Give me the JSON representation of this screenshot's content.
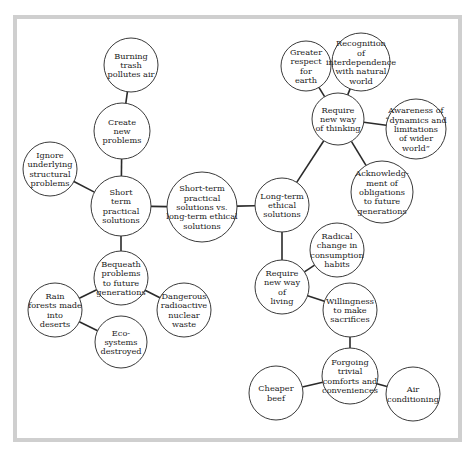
{
  "diagram": {
    "type": "concept-map",
    "colors": {
      "frame": "#cfcfcf",
      "stroke": "#3a3a3a",
      "text": "#222222",
      "background": "#ffffff"
    },
    "nodes": [
      {
        "id": "center",
        "cx": 202,
        "cy": 207,
        "r": 35,
        "lines": [
          "Short-term",
          "practical",
          "solutions vs.",
          "long-term ethical",
          "solutions"
        ]
      },
      {
        "id": "short_term",
        "cx": 121,
        "cy": 206,
        "r": 30,
        "lines": [
          "Short",
          "term",
          "practical",
          "solutions"
        ]
      },
      {
        "id": "create_new",
        "cx": 122,
        "cy": 131,
        "r": 28,
        "lines": [
          "Create",
          "new",
          "problems"
        ]
      },
      {
        "id": "burning_trash",
        "cx": 131,
        "cy": 65,
        "r": 27,
        "lines": [
          "Burning",
          "trash",
          "pollutes air"
        ]
      },
      {
        "id": "ignore_underlying",
        "cx": 50,
        "cy": 169,
        "r": 27,
        "lines": [
          "Ignore",
          "underlying",
          "structural",
          "problems"
        ]
      },
      {
        "id": "bequeath",
        "cx": 121,
        "cy": 278,
        "r": 27,
        "lines": [
          "Bequeath",
          "problems",
          "to future",
          "generations"
        ]
      },
      {
        "id": "rain_forests",
        "cx": 55,
        "cy": 310,
        "r": 27,
        "lines": [
          "Rain",
          "forests made",
          "into",
          "deserts"
        ]
      },
      {
        "id": "dangerous_waste",
        "cx": 184,
        "cy": 310,
        "r": 27,
        "lines": [
          "Dangerous",
          "radioactive",
          "nuclear",
          "waste"
        ]
      },
      {
        "id": "ecosystems",
        "cx": 121,
        "cy": 342,
        "r": 26,
        "lines": [
          "Eco-",
          "systems",
          "destroyed"
        ]
      },
      {
        "id": "long_term",
        "cx": 282,
        "cy": 205,
        "r": 27,
        "lines": [
          "Long-term",
          "ethical",
          "solutions"
        ]
      },
      {
        "id": "new_thinking",
        "cx": 338,
        "cy": 119,
        "r": 26,
        "lines": [
          "Require",
          "new way",
          "of thinking"
        ]
      },
      {
        "id": "greater_respect",
        "cx": 306,
        "cy": 66,
        "r": 25,
        "lines": [
          "Greater",
          "respect",
          "for",
          "earth"
        ]
      },
      {
        "id": "recognition",
        "cx": 361,
        "cy": 62,
        "r": 29,
        "lines": [
          "Recognition",
          "of",
          "interdependence",
          "with natural",
          "world"
        ]
      },
      {
        "id": "awareness",
        "cx": 416,
        "cy": 129,
        "r": 30,
        "lines": [
          "Awareness of",
          "“dynamics and",
          "limitations",
          "of wider",
          "world”"
        ]
      },
      {
        "id": "acknowledgment",
        "cx": 382,
        "cy": 192,
        "r": 31,
        "lines": [
          "Acknowledg-",
          "ment of",
          "obligations",
          "to future",
          "generations"
        ]
      },
      {
        "id": "new_living",
        "cx": 282,
        "cy": 287,
        "r": 27,
        "lines": [
          "Require",
          "new way",
          "of",
          "living"
        ]
      },
      {
        "id": "radical_change",
        "cx": 337,
        "cy": 250,
        "r": 27,
        "lines": [
          "Radical",
          "change in",
          "consumption",
          "habits"
        ]
      },
      {
        "id": "willingness",
        "cx": 350,
        "cy": 310,
        "r": 27,
        "lines": [
          "Willingness",
          "to make",
          "sacrifices"
        ]
      },
      {
        "id": "forgoing",
        "cx": 350,
        "cy": 376,
        "r": 28,
        "lines": [
          "Forgoing",
          "trivial",
          "comforts and",
          "conveniences"
        ]
      },
      {
        "id": "cheaper_beef",
        "cx": 276,
        "cy": 393,
        "r": 27,
        "lines": [
          "Cheaper",
          "beef"
        ]
      },
      {
        "id": "air_conditioning",
        "cx": 413,
        "cy": 394,
        "r": 27,
        "lines": [
          "Air",
          "conditioning"
        ]
      }
    ],
    "edges": [
      [
        "center",
        "short_term"
      ],
      [
        "center",
        "long_term"
      ],
      [
        "short_term",
        "create_new"
      ],
      [
        "create_new",
        "burning_trash"
      ],
      [
        "short_term",
        "ignore_underlying"
      ],
      [
        "short_term",
        "bequeath"
      ],
      [
        "bequeath",
        "rain_forests"
      ],
      [
        "bequeath",
        "dangerous_waste"
      ],
      [
        "rain_forests",
        "ecosystems"
      ],
      [
        "long_term",
        "new_thinking"
      ],
      [
        "new_thinking",
        "greater_respect"
      ],
      [
        "new_thinking",
        "recognition"
      ],
      [
        "new_thinking",
        "awareness"
      ],
      [
        "new_thinking",
        "acknowledgment"
      ],
      [
        "long_term",
        "new_living"
      ],
      [
        "new_living",
        "radical_change"
      ],
      [
        "new_living",
        "willingness"
      ],
      [
        "willingness",
        "forgoing"
      ],
      [
        "forgoing",
        "cheaper_beef"
      ],
      [
        "forgoing",
        "air_conditioning"
      ]
    ]
  }
}
